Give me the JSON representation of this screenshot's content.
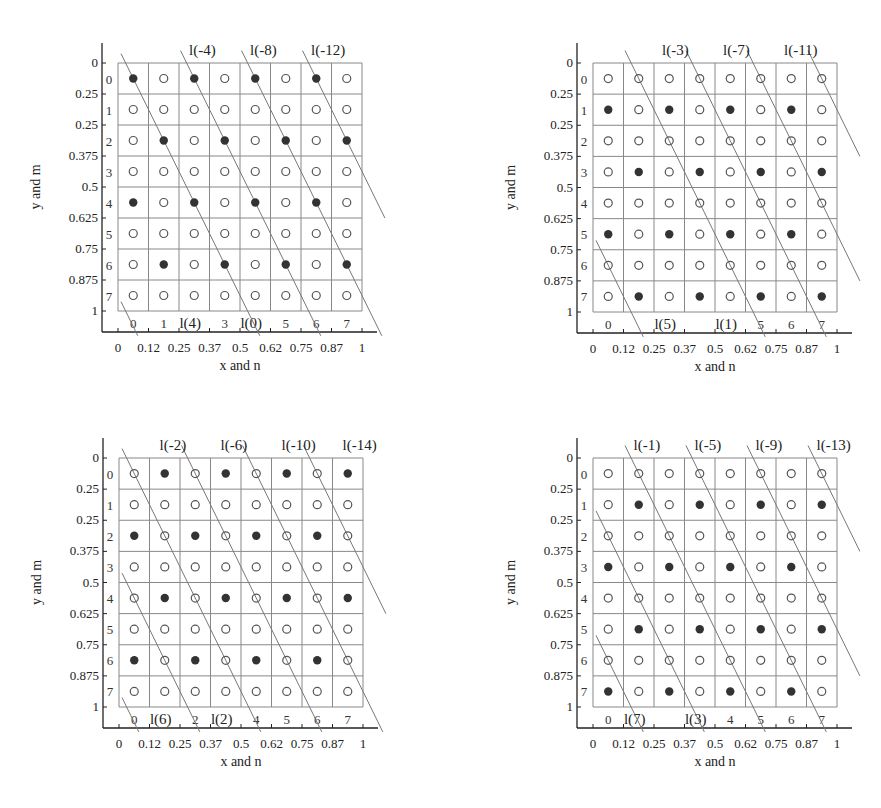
{
  "figure": {
    "colors": {
      "grid": "#888888",
      "axis": "#222222",
      "line": "#777777",
      "filled_dot": "#333333",
      "open_dot": "#555555"
    }
  },
  "chart_data": [
    {
      "type": "scatter",
      "panel": "top-left",
      "xlabel": "x and n",
      "ylabel": "y and m",
      "x_ticks": [
        "0",
        "0.12",
        "0.25",
        "0.37",
        "0.5",
        "0.62",
        "0.75",
        "0.87",
        "1"
      ],
      "y_ticks": [
        "0",
        "0.25",
        "0.25",
        "0.375",
        "0.5",
        "0.625",
        "0.75",
        "0.875",
        "1"
      ],
      "row_labels": [
        "0",
        "1",
        "2",
        "3",
        "4",
        "5",
        "6",
        "7"
      ],
      "col_labels": [
        "0",
        "1",
        "l(4)",
        "3",
        "l(0)",
        "5",
        "6",
        "7"
      ],
      "top_line_labels": [
        "l(-4)",
        "l(-8)",
        "l(-12)"
      ],
      "grid_size": [
        8,
        8
      ],
      "filled": [
        [
          0,
          0
        ],
        [
          0,
          2
        ],
        [
          0,
          4
        ],
        [
          0,
          6
        ],
        [
          2,
          1
        ],
        [
          2,
          3
        ],
        [
          2,
          5
        ],
        [
          2,
          7
        ],
        [
          4,
          0
        ],
        [
          4,
          2
        ],
        [
          4,
          4
        ],
        [
          4,
          6
        ],
        [
          6,
          1
        ],
        [
          6,
          3
        ],
        [
          6,
          5
        ],
        [
          6,
          7
        ]
      ],
      "line_offsets": [
        0,
        2,
        4,
        6,
        -4
      ]
    },
    {
      "type": "scatter",
      "panel": "top-right",
      "xlabel": "x and n",
      "ylabel": "y and m",
      "x_ticks": [
        "0",
        "0.12",
        "0.25",
        "0.37",
        "0.5",
        "0.62",
        "0.75",
        "0.87",
        "1"
      ],
      "y_ticks": [
        "0",
        "0.25",
        "0.25",
        "0.375",
        "0.5",
        "0.625",
        "0.75",
        "0.875",
        "1"
      ],
      "row_labels": [
        "0",
        "1",
        "2",
        "3",
        "4",
        "5",
        "6",
        "7"
      ],
      "col_labels": [
        "0",
        "",
        "l(5)",
        "",
        "l(1)",
        "5",
        "6",
        "7"
      ],
      "top_line_labels": [
        "l(-3)",
        "l(-7)",
        "l(-11)"
      ],
      "grid_size": [
        8,
        8
      ],
      "filled": [
        [
          1,
          0
        ],
        [
          1,
          2
        ],
        [
          1,
          4
        ],
        [
          1,
          6
        ],
        [
          3,
          1
        ],
        [
          3,
          3
        ],
        [
          3,
          5
        ],
        [
          3,
          7
        ],
        [
          5,
          0
        ],
        [
          5,
          2
        ],
        [
          5,
          4
        ],
        [
          5,
          6
        ],
        [
          7,
          1
        ],
        [
          7,
          3
        ],
        [
          7,
          5
        ],
        [
          7,
          7
        ]
      ],
      "line_offsets": [
        1,
        3,
        5,
        7,
        -3
      ]
    },
    {
      "type": "scatter",
      "panel": "bottom-left",
      "xlabel": "x and n",
      "ylabel": "y and m",
      "x_ticks": [
        "0",
        "0.12",
        "0.25",
        "0.37",
        "0.5",
        "0.62",
        "0.75",
        "0.87",
        "1"
      ],
      "y_ticks": [
        "0",
        "0.25",
        "0.25",
        "0.375",
        "0.5",
        "0.625",
        "0.75",
        "0.875",
        "1"
      ],
      "row_labels": [
        "0",
        "1",
        "2",
        "3",
        "4",
        "5",
        "6",
        "7"
      ],
      "col_labels": [
        "0",
        "l(6)",
        "2",
        "l(2)",
        "4",
        "5",
        "6",
        "7"
      ],
      "top_line_labels": [
        "l(-2)",
        "l(-6)",
        "l(-10)",
        "l(-14)"
      ],
      "grid_size": [
        8,
        8
      ],
      "filled": [
        [
          0,
          1
        ],
        [
          0,
          3
        ],
        [
          0,
          5
        ],
        [
          0,
          7
        ],
        [
          2,
          0
        ],
        [
          2,
          2
        ],
        [
          2,
          4
        ],
        [
          2,
          6
        ],
        [
          4,
          1
        ],
        [
          4,
          3
        ],
        [
          4,
          5
        ],
        [
          4,
          7
        ],
        [
          6,
          0
        ],
        [
          6,
          2
        ],
        [
          6,
          4
        ],
        [
          6,
          6
        ]
      ],
      "line_offsets": [
        -2,
        0,
        2,
        4,
        6,
        -4
      ]
    },
    {
      "type": "scatter",
      "panel": "bottom-right",
      "xlabel": "x and n",
      "ylabel": "y and m",
      "x_ticks": [
        "0",
        "0.12",
        "0.25",
        "0.37",
        "0.5",
        "0.62",
        "0.75",
        "0.87",
        "1"
      ],
      "y_ticks": [
        "0",
        "0.25",
        "0.25",
        "0.375",
        "0.5",
        "0.625",
        "0.75",
        "0.875",
        "1"
      ],
      "row_labels": [
        "0",
        "1",
        "2",
        "3",
        "4",
        "5",
        "6",
        "7"
      ],
      "col_labels": [
        "0",
        "l(7)",
        "",
        "l(3)",
        "4",
        "5",
        "6",
        "7"
      ],
      "top_line_labels": [
        "l(-1)",
        "l(-5)",
        "l(-9)",
        "l(-13)"
      ],
      "grid_size": [
        8,
        8
      ],
      "filled": [
        [
          1,
          1
        ],
        [
          1,
          3
        ],
        [
          1,
          5
        ],
        [
          1,
          7
        ],
        [
          3,
          0
        ],
        [
          3,
          2
        ],
        [
          3,
          4
        ],
        [
          3,
          6
        ],
        [
          5,
          1
        ],
        [
          5,
          3
        ],
        [
          5,
          5
        ],
        [
          5,
          7
        ],
        [
          7,
          0
        ],
        [
          7,
          2
        ],
        [
          7,
          4
        ],
        [
          7,
          6
        ]
      ],
      "line_offsets": [
        -1,
        1,
        3,
        5,
        7,
        -3
      ]
    }
  ]
}
